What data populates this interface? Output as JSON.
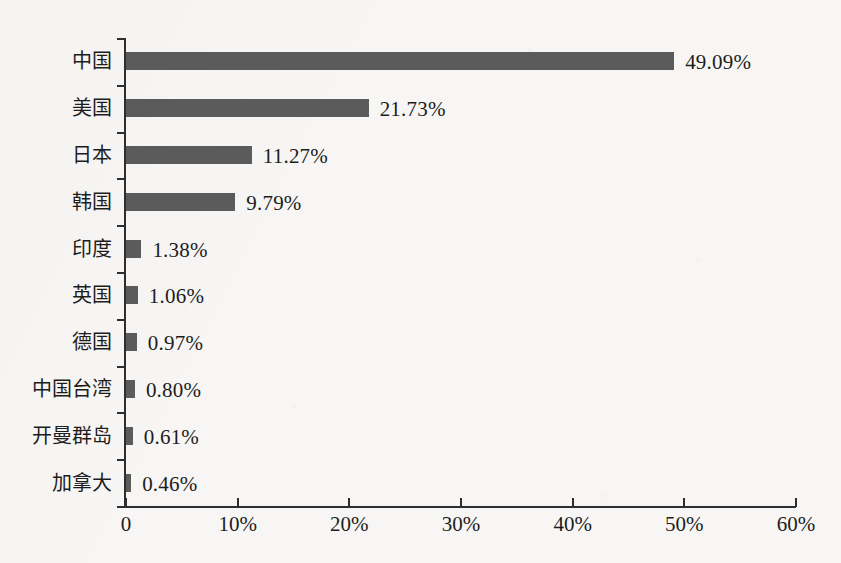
{
  "chart_data": {
    "type": "bar",
    "orientation": "horizontal",
    "title": "",
    "subtitle": "",
    "xlabel": "",
    "ylabel": "",
    "xlim": [
      0,
      60
    ],
    "ylim": null,
    "grid": false,
    "legend": null,
    "bar_color": "#5b5b5b",
    "axis_color": "#2e2e2e",
    "background_color": "#f7f6f4",
    "categories": [
      "中国",
      "美国",
      "日本",
      "韩国",
      "印度",
      "英国",
      "德国",
      "中国台湾",
      "开曼群岛",
      "加拿大"
    ],
    "values": [
      49.09,
      21.73,
      11.27,
      9.79,
      1.38,
      1.06,
      0.97,
      0.8,
      0.61,
      0.46
    ],
    "value_labels": [
      "49.09%",
      "21.73%",
      "11.27%",
      "9.79%",
      "1.38%",
      "1.06%",
      "0.97%",
      "0.80%",
      "0.61%",
      "0.46%"
    ],
    "xticks": [
      0,
      10,
      20,
      30,
      40,
      50,
      60
    ],
    "xtick_labels": [
      "0",
      "10%",
      "20%",
      "30%",
      "40%",
      "50%",
      "60%"
    ],
    "bars": [
      {
        "category": "中国",
        "value": 49.09,
        "label": "49.09%"
      },
      {
        "category": "美国",
        "value": 21.73,
        "label": "21.73%"
      },
      {
        "category": "日本",
        "value": 11.27,
        "label": "11.27%"
      },
      {
        "category": "韩国",
        "value": 9.79,
        "label": "9.79%"
      },
      {
        "category": "印度",
        "value": 1.38,
        "label": "1.38%"
      },
      {
        "category": "英国",
        "value": 1.06,
        "label": "1.06%"
      },
      {
        "category": "德国",
        "value": 0.97,
        "label": "0.97%"
      },
      {
        "category": "中国台湾",
        "value": 0.8,
        "label": "0.80%"
      },
      {
        "category": "开曼群岛",
        "value": 0.61,
        "label": "0.61%"
      },
      {
        "category": "加拿大",
        "value": 0.46,
        "label": "0.46%"
      }
    ]
  }
}
